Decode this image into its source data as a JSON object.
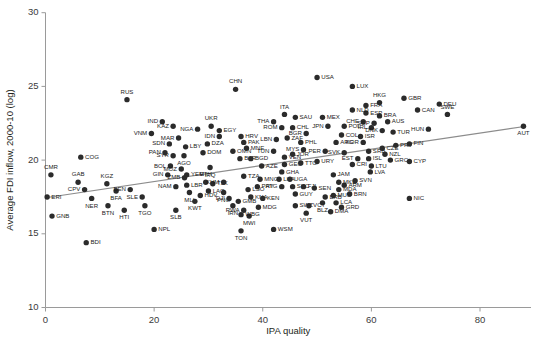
{
  "chart_data": {
    "type": "scatter",
    "title": "",
    "xlabel": "IPA quality",
    "ylabel": "Average FDI inflow, 2000-10 (log)",
    "xlim": [
      0,
      90
    ],
    "ylim": [
      10,
      30
    ],
    "xticks": [
      0,
      20,
      40,
      60,
      80
    ],
    "yticks": [
      10,
      15,
      20,
      25,
      30
    ],
    "xtick_labels": [
      "0",
      "20",
      "40",
      "60",
      "80"
    ],
    "ytick_labels": [
      "10",
      "15",
      "20",
      "25",
      "30"
    ],
    "grid": false,
    "legend": "none",
    "marker": "filled-circle",
    "marker_color": "#2b2b2b",
    "trendline": {
      "type": "linear-fit",
      "color": "#8c8c8c",
      "x0": 0.0,
      "y0": 17.45,
      "x1": 88.5,
      "y1": 22.3
    },
    "point_label_mode": "iso3-country-code",
    "points": [
      {
        "label": "CMR",
        "x": 1.0,
        "y": 19.0,
        "lp": "up"
      },
      {
        "label": "ERI",
        "x": 0.3,
        "y": 17.5,
        "lp": "r"
      },
      {
        "label": "GNB",
        "x": 1.2,
        "y": 16.2,
        "lp": "r"
      },
      {
        "label": "CPV",
        "x": 7.2,
        "y": 18.0,
        "lp": "l"
      },
      {
        "label": "GAB",
        "x": 6.0,
        "y": 18.5,
        "lp": "up"
      },
      {
        "label": "NER",
        "x": 8.5,
        "y": 17.4,
        "lp": "dn"
      },
      {
        "label": "BDI",
        "x": 7.5,
        "y": 14.4,
        "lp": "r"
      },
      {
        "label": "COG",
        "x": 6.5,
        "y": 20.2,
        "lp": "r"
      },
      {
        "label": "KGZ",
        "x": 11.3,
        "y": 18.4,
        "lp": "up"
      },
      {
        "label": "BFA",
        "x": 13.0,
        "y": 17.9,
        "lp": "dn"
      },
      {
        "label": "BTN",
        "x": 11.5,
        "y": 16.9,
        "lp": "dn"
      },
      {
        "label": "HTI",
        "x": 14.5,
        "y": 16.6,
        "lp": "dn"
      },
      {
        "label": "BEN",
        "x": 15.6,
        "y": 18.0,
        "lp": "l"
      },
      {
        "label": "SLE",
        "x": 17.8,
        "y": 17.5,
        "lp": "l"
      },
      {
        "label": "TGO",
        "x": 18.3,
        "y": 16.9,
        "lp": "dn"
      },
      {
        "label": "RUS",
        "x": 15.0,
        "y": 24.1,
        "lp": "up"
      },
      {
        "label": "SYR",
        "x": 23.5,
        "y": 20.3,
        "lp": "l"
      },
      {
        "label": "BOL",
        "x": 23.0,
        "y": 19.6,
        "lp": "l"
      },
      {
        "label": "GIN",
        "x": 22.5,
        "y": 19.0,
        "lp": "l"
      },
      {
        "label": "VNM",
        "x": 19.5,
        "y": 21.8,
        "lp": "l"
      },
      {
        "label": "SDN",
        "x": 22.8,
        "y": 21.1,
        "lp": "l"
      },
      {
        "label": "IND",
        "x": 21.5,
        "y": 22.6,
        "lp": "l"
      },
      {
        "label": "KAZ",
        "x": 23.5,
        "y": 22.3,
        "lp": "l"
      },
      {
        "label": "PAN",
        "x": 22.0,
        "y": 20.5,
        "lp": "l"
      },
      {
        "label": "MAR",
        "x": 24.5,
        "y": 21.5,
        "lp": "l"
      },
      {
        "label": "LBY",
        "x": 25.8,
        "y": 20.9,
        "lp": "r"
      },
      {
        "label": "AGO",
        "x": 25.5,
        "y": 20.3,
        "lp": "dn"
      },
      {
        "label": "MOZ",
        "x": 25.0,
        "y": 19.4,
        "lp": "l"
      },
      {
        "label": "ZMB",
        "x": 25.6,
        "y": 18.8,
        "lp": "l"
      },
      {
        "label": "NAM",
        "x": 24.0,
        "y": 18.2,
        "lp": "l"
      },
      {
        "label": "MLI",
        "x": 26.5,
        "y": 17.8,
        "lp": "dn"
      },
      {
        "label": "LBR",
        "x": 26.0,
        "y": 18.3,
        "lp": "r"
      },
      {
        "label": "SLB",
        "x": 24.0,
        "y": 16.6,
        "lp": "dn"
      },
      {
        "label": "KWT",
        "x": 27.5,
        "y": 17.2,
        "lp": "dn"
      },
      {
        "label": "HDV",
        "x": 28.5,
        "y": 17.6,
        "lp": "r"
      },
      {
        "label": "NPL",
        "x": 20.0,
        "y": 15.3,
        "lp": "r"
      },
      {
        "label": "NGA",
        "x": 28.0,
        "y": 22.1,
        "lp": "l"
      },
      {
        "label": "UKR",
        "x": 30.5,
        "y": 22.3,
        "lp": "up"
      },
      {
        "label": "EGY",
        "x": 32.0,
        "y": 22.0,
        "lp": "r"
      },
      {
        "label": "IDN",
        "x": 32.0,
        "y": 21.6,
        "lp": "l"
      },
      {
        "label": "DZA",
        "x": 29.8,
        "y": 21.1,
        "lp": "r"
      },
      {
        "label": "DOM",
        "x": 29.0,
        "y": 20.5,
        "lp": "r"
      },
      {
        "label": "YEM",
        "x": 26.0,
        "y": 19.0,
        "lp": "r"
      },
      {
        "label": "IRQ",
        "x": 30.3,
        "y": 19.5,
        "lp": "dn"
      },
      {
        "label": "ETH",
        "x": 29.5,
        "y": 18.5,
        "lp": "up"
      },
      {
        "label": "TJK",
        "x": 30.8,
        "y": 18.4,
        "lp": "r"
      },
      {
        "label": "LAO",
        "x": 30.0,
        "y": 17.9,
        "lp": "r"
      },
      {
        "label": "PNG",
        "x": 32.8,
        "y": 17.8,
        "lp": "dn"
      },
      {
        "label": "KHM",
        "x": 32.8,
        "y": 18.5,
        "lp": "l"
      },
      {
        "label": "DJI",
        "x": 33.8,
        "y": 17.4,
        "lp": "l"
      },
      {
        "label": "IRN",
        "x": 34.5,
        "y": 16.9,
        "lp": "dn"
      },
      {
        "label": "GMB",
        "x": 35.5,
        "y": 17.2,
        "lp": "r"
      },
      {
        "label": "RWA",
        "x": 36.5,
        "y": 16.6,
        "lp": "l"
      },
      {
        "label": "MWI",
        "x": 37.5,
        "y": 16.2,
        "lp": "dn"
      },
      {
        "label": "WBG",
        "x": 36.0,
        "y": 16.3,
        "lp": "r"
      },
      {
        "label": "TON",
        "x": 36.0,
        "y": 15.2,
        "lp": "dn"
      },
      {
        "label": "WSM",
        "x": 42.0,
        "y": 15.3,
        "lp": "r"
      },
      {
        "label": "CHN",
        "x": 35.0,
        "y": 24.8,
        "lp": "up"
      },
      {
        "label": "HRV",
        "x": 36.0,
        "y": 21.6,
        "lp": "r"
      },
      {
        "label": "PAK",
        "x": 36.5,
        "y": 21.2,
        "lp": "r"
      },
      {
        "label": "OMN",
        "x": 34.5,
        "y": 20.6,
        "lp": "r"
      },
      {
        "label": "MNE",
        "x": 37.0,
        "y": 20.8,
        "lp": "r"
      },
      {
        "label": "BLR",
        "x": 35.8,
        "y": 20.1,
        "lp": "r"
      },
      {
        "label": "BGD",
        "x": 37.8,
        "y": 20.1,
        "lp": "r"
      },
      {
        "label": "AZE",
        "x": 39.8,
        "y": 19.6,
        "lp": "r"
      },
      {
        "label": "TZA",
        "x": 36.5,
        "y": 18.9,
        "lp": "r"
      },
      {
        "label": "MNG",
        "x": 39.5,
        "y": 18.7,
        "lp": "r"
      },
      {
        "label": "LSO",
        "x": 37.3,
        "y": 18.0,
        "lp": "r"
      },
      {
        "label": "PRY",
        "x": 39.0,
        "y": 18.2,
        "lp": "r"
      },
      {
        "label": "KNA",
        "x": 37.8,
        "y": 17.5,
        "lp": "r"
      },
      {
        "label": "KEN",
        "x": 40.0,
        "y": 17.4,
        "lp": "r"
      },
      {
        "label": "MDG",
        "x": 39.2,
        "y": 16.8,
        "lp": "r"
      },
      {
        "label": "THA",
        "x": 42.0,
        "y": 22.6,
        "lp": "l"
      },
      {
        "label": "ITA",
        "x": 44.0,
        "y": 23.1,
        "lp": "up"
      },
      {
        "label": "SAU",
        "x": 46.0,
        "y": 22.9,
        "lp": "r"
      },
      {
        "label": "ROM",
        "x": 43.5,
        "y": 22.2,
        "lp": "l"
      },
      {
        "label": "TUN",
        "x": 42.0,
        "y": 20.6,
        "lp": "l"
      },
      {
        "label": "VEN",
        "x": 44.0,
        "y": 20.2,
        "lp": "r"
      },
      {
        "label": "GEO",
        "x": 44.0,
        "y": 19.7,
        "lp": "r"
      },
      {
        "label": "GHA",
        "x": 43.5,
        "y": 19.2,
        "lp": "r"
      },
      {
        "label": "LKA",
        "x": 43.0,
        "y": 18.7,
        "lp": "r"
      },
      {
        "label": "UGA",
        "x": 45.0,
        "y": 18.7,
        "lp": "r"
      },
      {
        "label": "SYC",
        "x": 45.5,
        "y": 18.2,
        "lp": "r"
      },
      {
        "label": "ATG",
        "x": 43.5,
        "y": 18.2,
        "lp": "l"
      },
      {
        "label": "GUY",
        "x": 46.0,
        "y": 17.7,
        "lp": "r"
      },
      {
        "label": "FJI",
        "x": 47.5,
        "y": 18.2,
        "lp": "r"
      },
      {
        "label": "SEN",
        "x": 49.5,
        "y": 18.1,
        "lp": "r"
      },
      {
        "label": "SWZ",
        "x": 46.0,
        "y": 16.9,
        "lp": "r"
      },
      {
        "label": "VCT",
        "x": 48.5,
        "y": 16.9,
        "lp": "r"
      },
      {
        "label": "VUT",
        "x": 48.0,
        "y": 16.4,
        "lp": "dn"
      },
      {
        "label": "DMA",
        "x": 52.5,
        "y": 16.5,
        "lp": "r"
      },
      {
        "label": "BRB",
        "x": 51.5,
        "y": 17.5,
        "lp": "r"
      },
      {
        "label": "BLZ",
        "x": 51.0,
        "y": 17.1,
        "lp": "dn"
      },
      {
        "label": "LCA",
        "x": 53.5,
        "y": 17.1,
        "lp": "r"
      },
      {
        "label": "GRD",
        "x": 54.5,
        "y": 16.8,
        "lp": "r"
      },
      {
        "label": "MUS",
        "x": 53.0,
        "y": 17.6,
        "lp": "r"
      },
      {
        "label": "BRN",
        "x": 56.0,
        "y": 17.7,
        "lp": "r"
      },
      {
        "label": "MDA",
        "x": 54.0,
        "y": 18.0,
        "lp": "r"
      },
      {
        "label": "ARM",
        "x": 55.0,
        "y": 18.3,
        "lp": "r"
      },
      {
        "label": "MKD",
        "x": 54.0,
        "y": 18.5,
        "lp": "r"
      },
      {
        "label": "SVN",
        "x": 57.0,
        "y": 18.6,
        "lp": "r"
      },
      {
        "label": "JAM",
        "x": 53.0,
        "y": 19.0,
        "lp": "r"
      },
      {
        "label": "USA",
        "x": 50.0,
        "y": 25.6,
        "lp": "r"
      },
      {
        "label": "MEX",
        "x": 51.0,
        "y": 22.9,
        "lp": "r"
      },
      {
        "label": "CHL",
        "x": 45.5,
        "y": 22.2,
        "lp": "r"
      },
      {
        "label": "ZAF",
        "x": 44.5,
        "y": 21.5,
        "lp": "r"
      },
      {
        "label": "LBN",
        "x": 42.5,
        "y": 21.4,
        "lp": "l"
      },
      {
        "label": "PHL",
        "x": 47.0,
        "y": 21.2,
        "lp": "r"
      },
      {
        "label": "MYS",
        "x": 47.5,
        "y": 20.7,
        "lp": "l"
      },
      {
        "label": "BGR",
        "x": 48.0,
        "y": 21.8,
        "lp": "l"
      },
      {
        "label": "JOR",
        "x": 45.5,
        "y": 20.4,
        "lp": "r"
      },
      {
        "label": "TTO",
        "x": 47.0,
        "y": 19.8,
        "lp": "r"
      },
      {
        "label": "URY",
        "x": 50.0,
        "y": 19.9,
        "lp": "r"
      },
      {
        "label": "PER",
        "x": 51.5,
        "y": 20.6,
        "lp": "l"
      },
      {
        "label": "ARG",
        "x": 53.5,
        "y": 21.2,
        "lp": "r"
      },
      {
        "label": "COL",
        "x": 54.5,
        "y": 21.7,
        "lp": "r"
      },
      {
        "label": "JPN",
        "x": 52.0,
        "y": 22.3,
        "lp": "l"
      },
      {
        "label": "POL",
        "x": 55.0,
        "y": 22.3,
        "lp": "r"
      },
      {
        "label": "SVK",
        "x": 55.0,
        "y": 20.5,
        "lp": "l"
      },
      {
        "label": "CRI",
        "x": 56.5,
        "y": 19.7,
        "lp": "r"
      },
      {
        "label": "EST",
        "x": 57.5,
        "y": 20.1,
        "lp": "l"
      },
      {
        "label": "ISL",
        "x": 59.5,
        "y": 20.1,
        "lp": "r"
      },
      {
        "label": "LTU",
        "x": 60.0,
        "y": 19.6,
        "lp": "r"
      },
      {
        "label": "LVA",
        "x": 59.8,
        "y": 19.2,
        "lp": "r"
      },
      {
        "label": "SRB",
        "x": 59.5,
        "y": 20.6,
        "lp": "r"
      },
      {
        "label": "KOR",
        "x": 58.5,
        "y": 21.2,
        "lp": "l"
      },
      {
        "label": "ISR",
        "x": 58.0,
        "y": 21.6,
        "lp": "r"
      },
      {
        "label": "IRL",
        "x": 60.0,
        "y": 22.2,
        "lp": "l"
      },
      {
        "label": "CHE",
        "x": 58.5,
        "y": 22.6,
        "lp": "l"
      },
      {
        "label": "CZE",
        "x": 62.0,
        "y": 20.8,
        "lp": "r"
      },
      {
        "label": "GRC",
        "x": 63.5,
        "y": 20.0,
        "lp": "r"
      },
      {
        "label": "NZL",
        "x": 62.5,
        "y": 20.4,
        "lp": "r"
      },
      {
        "label": "CYP",
        "x": 67.0,
        "y": 19.9,
        "lp": "r"
      },
      {
        "label": "NIC",
        "x": 67.0,
        "y": 17.4,
        "lp": "r"
      },
      {
        "label": "DNK",
        "x": 62.0,
        "y": 22.0,
        "lp": "l"
      },
      {
        "label": "TUR",
        "x": 64.0,
        "y": 21.9,
        "lp": "r"
      },
      {
        "label": "PRT",
        "x": 64.5,
        "y": 21.0,
        "lp": "r"
      },
      {
        "label": "FIN",
        "x": 67.0,
        "y": 21.1,
        "lp": "r"
      },
      {
        "label": "SGP",
        "x": 60.5,
        "y": 22.5,
        "lp": "l"
      },
      {
        "label": "AUS",
        "x": 63.0,
        "y": 22.6,
        "lp": "r"
      },
      {
        "label": "BRA",
        "x": 61.5,
        "y": 23.0,
        "lp": "r"
      },
      {
        "label": "ESP",
        "x": 59.0,
        "y": 23.2,
        "lp": "r"
      },
      {
        "label": "NLD",
        "x": 56.5,
        "y": 23.4,
        "lp": "r"
      },
      {
        "label": "FRA",
        "x": 59.0,
        "y": 23.7,
        "lp": "r"
      },
      {
        "label": "HKG",
        "x": 61.5,
        "y": 23.9,
        "lp": "up"
      },
      {
        "label": "GBR",
        "x": 66.0,
        "y": 24.2,
        "lp": "r"
      },
      {
        "label": "CAN",
        "x": 68.5,
        "y": 23.4,
        "lp": "r"
      },
      {
        "label": "DEU",
        "x": 72.5,
        "y": 23.8,
        "lp": "r"
      },
      {
        "label": "SWE",
        "x": 74.0,
        "y": 23.1,
        "lp": "up"
      },
      {
        "label": "HUN",
        "x": 70.5,
        "y": 22.1,
        "lp": "l"
      },
      {
        "label": "LUX",
        "x": 56.5,
        "y": 25.0,
        "lp": "r"
      },
      {
        "label": "AUT",
        "x": 88.0,
        "y": 22.3,
        "lp": "dn"
      }
    ]
  }
}
